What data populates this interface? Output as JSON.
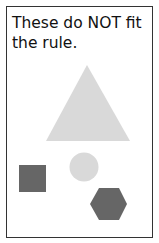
{
  "caption": "These do NOT fit the rule.",
  "shapes": [
    {
      "type": "triangle",
      "color": "#d9d9d9"
    },
    {
      "type": "circle",
      "color": "#d9d9d9"
    },
    {
      "type": "square",
      "color": "#666666"
    },
    {
      "type": "hexagon",
      "color": "#666666"
    }
  ]
}
